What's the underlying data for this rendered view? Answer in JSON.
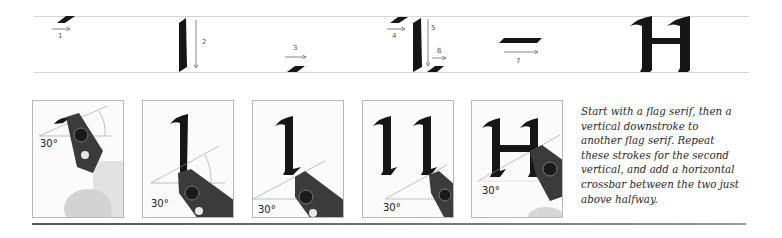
{
  "stroke_sequence": {
    "steps": [
      {
        "number": "1",
        "stroke": "flag serif",
        "direction": "right"
      },
      {
        "number": "2",
        "stroke": "vertical downstroke",
        "direction": "down"
      },
      {
        "number": "3",
        "stroke": "flag serif",
        "direction": "right"
      },
      {
        "number": "4",
        "stroke": "flag serif",
        "direction": "right"
      },
      {
        "number": "5",
        "stroke": "vertical downstroke",
        "direction": "down"
      },
      {
        "number": "6",
        "stroke": "flag serif",
        "direction": "right"
      },
      {
        "number": "7",
        "stroke": "horizontal crossbar",
        "direction": "right"
      }
    ],
    "result_letter": "H"
  },
  "panels": [
    {
      "angle_label": "30°",
      "stage": "pen at first flag serif"
    },
    {
      "angle_label": "30°",
      "stage": "first vertical stroke"
    },
    {
      "angle_label": "30°",
      "stage": "first vertical with base serif"
    },
    {
      "angle_label": "30°",
      "stage": "second vertical"
    },
    {
      "angle_label": "30°",
      "stage": "crossbar added"
    }
  ],
  "caption": {
    "lines": [
      "Start with a flag serif, then a",
      "vertical downstroke to",
      "another flag serif. Repeat",
      "these strokes for the second",
      "vertical, and add a horizontal",
      "crossbar between the two just",
      "above halfway."
    ]
  },
  "colors": {
    "ink": "#161616",
    "guide": "#d6d6d6",
    "arrow": "#6a6a6a",
    "panel_border": "#b9b9b9"
  }
}
